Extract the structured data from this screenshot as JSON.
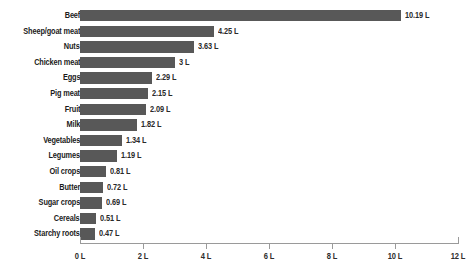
{
  "chart_data": {
    "type": "bar",
    "orientation": "horizontal",
    "title": "",
    "subtitle": "",
    "xlabel": "",
    "ylabel": "",
    "xlim": [
      0,
      12
    ],
    "grid": false,
    "legend": null,
    "unit": "L",
    "bar_color": "#585858",
    "axis_color": "#9a9a9a",
    "label_color": "#1b1b1b",
    "xticks": [
      0,
      2,
      4,
      6,
      8,
      10,
      12
    ],
    "xticklabels": [
      "0 L",
      "2 L",
      "4 L",
      "6 L",
      "8 L",
      "10 L",
      "12 L"
    ],
    "categories": [
      "Beef",
      "Sheep/goat meat",
      "Nuts",
      "Chicken meat",
      "Eggs",
      "Pig meat",
      "Fruit",
      "Milk",
      "Vegetables",
      "Legumes",
      "Oil crops",
      "Butter",
      "Sugar crops",
      "Cereals",
      "Starchy roots"
    ],
    "values": [
      10.19,
      4.25,
      3.63,
      3,
      2.29,
      2.15,
      2.09,
      1.82,
      1.34,
      1.19,
      0.81,
      0.72,
      0.69,
      0.51,
      0.47
    ],
    "value_labels": [
      "10.19 L",
      "4.25 L",
      "3.63 L",
      "3 L",
      "2.29 L",
      "2.15 L",
      "2.09 L",
      "1.82 L",
      "1.34 L",
      "1.19 L",
      "0.81 L",
      "0.72 L",
      "0.69 L",
      "0.51 L",
      "0.47 L"
    ]
  }
}
